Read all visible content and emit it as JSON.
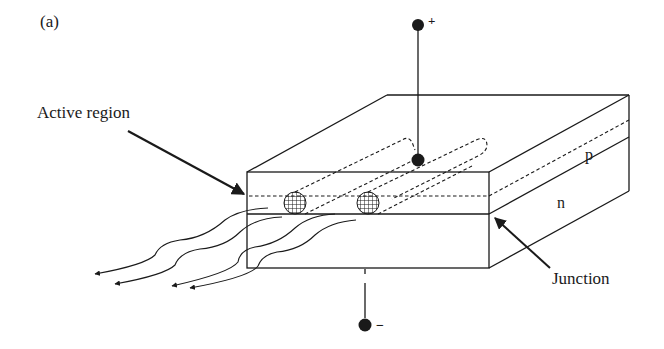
{
  "figure": {
    "panel_label": "(a)"
  },
  "labels": {
    "active_region": "Active region",
    "junction": "Junction",
    "p_layer": "p",
    "n_layer": "n",
    "positive_terminal": "+",
    "negative_terminal": "−"
  },
  "colors": {
    "line": "#1a1a1a",
    "background": "#ffffff"
  }
}
